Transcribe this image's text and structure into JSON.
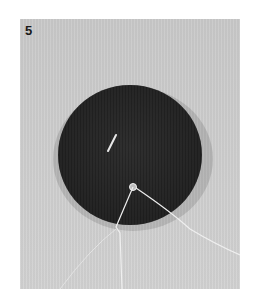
{
  "figure": {
    "step_number": "5",
    "colors": {
      "background": "#cdcdcd",
      "disc": "#2e2e2e",
      "thread": "#eeeeee"
    }
  }
}
